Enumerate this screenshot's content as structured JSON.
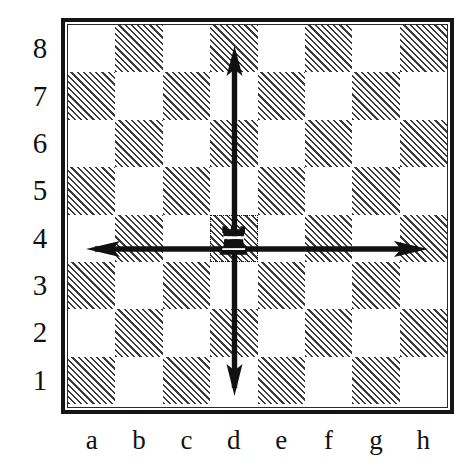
{
  "diagram": {
    "piece_name": "rook",
    "piece_color": "black",
    "piece_square": "d4",
    "rank_labels": [
      "8",
      "7",
      "6",
      "5",
      "4",
      "3",
      "2",
      "1"
    ],
    "file_labels": [
      "a",
      "b",
      "c",
      "d",
      "e",
      "f",
      "g",
      "h"
    ],
    "colors": {
      "ink": "#151515",
      "hatch": "#3a3a3a",
      "light_square": "#ffffff",
      "border": "#151515"
    }
  },
  "chart_data": {
    "type": "heatmap",
    "xlabel": "",
    "ylabel": "",
    "grid": true,
    "legend": "none",
    "categories": [
      "a",
      "b",
      "c",
      "d",
      "e",
      "f",
      "g",
      "h"
    ],
    "rows": [
      "8",
      "7",
      "6",
      "5",
      "4",
      "3",
      "2",
      "1"
    ],
    "square_shading_rule": "hatched when file_index + rank is odd",
    "squares": [
      {
        "rank": "8",
        "shading": [
          "light",
          "hatched",
          "light",
          "hatched",
          "light",
          "hatched",
          "light",
          "hatched"
        ]
      },
      {
        "rank": "7",
        "shading": [
          "hatched",
          "light",
          "hatched",
          "light",
          "hatched",
          "light",
          "hatched",
          "light"
        ]
      },
      {
        "rank": "6",
        "shading": [
          "light",
          "hatched",
          "light",
          "hatched",
          "light",
          "hatched",
          "light",
          "hatched"
        ]
      },
      {
        "rank": "5",
        "shading": [
          "hatched",
          "light",
          "hatched",
          "light",
          "hatched",
          "light",
          "hatched",
          "light"
        ]
      },
      {
        "rank": "4",
        "shading": [
          "light",
          "hatched",
          "light",
          "hatched",
          "light",
          "hatched",
          "light",
          "hatched"
        ]
      },
      {
        "rank": "3",
        "shading": [
          "hatched",
          "light",
          "hatched",
          "light",
          "hatched",
          "light",
          "hatched",
          "light"
        ]
      },
      {
        "rank": "2",
        "shading": [
          "light",
          "hatched",
          "light",
          "hatched",
          "light",
          "hatched",
          "light",
          "hatched"
        ]
      },
      {
        "rank": "1",
        "shading": [
          "hatched",
          "light",
          "hatched",
          "light",
          "hatched",
          "light",
          "hatched",
          "light"
        ]
      }
    ],
    "pieces": [
      {
        "type": "rook",
        "color": "black",
        "square": "d4",
        "file": "d",
        "rank": "4"
      }
    ],
    "annotations": [
      {
        "kind": "arrow",
        "label": "up",
        "from": "d4",
        "to": "d8",
        "direction": "north"
      },
      {
        "kind": "arrow",
        "label": "down",
        "from": "d4",
        "to": "d1",
        "direction": "south"
      },
      {
        "kind": "arrow",
        "label": "left",
        "from": "d4",
        "to": "a4",
        "direction": "west"
      },
      {
        "kind": "arrow",
        "label": "right",
        "from": "d4",
        "to": "h4",
        "direction": "east"
      }
    ]
  }
}
